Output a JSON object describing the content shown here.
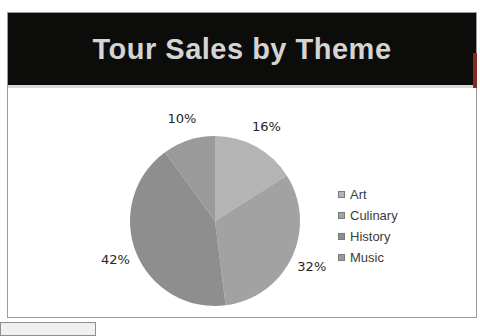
{
  "page": {
    "top_caption": "FIGURE P-65"
  },
  "theme": {
    "banner_background": "#0c0c0b",
    "banner_title_color": "#d4d4d4",
    "accent_red": "#7e2d1e",
    "slide_border": "#9b9b9b"
  },
  "slide": {
    "title": "Tour Sales by Theme"
  },
  "chart_data": {
    "type": "pie",
    "title": "Tour Sales by Theme",
    "categories": [
      "Art",
      "Culinary",
      "History",
      "Music"
    ],
    "values": [
      16,
      32,
      42,
      10
    ],
    "data_labels": [
      "16%",
      "32%",
      "42%",
      "10%"
    ],
    "colors": [
      "#b4b4b4",
      "#a2a2a2",
      "#8e8e8e",
      "#9a9a9a"
    ],
    "start_angle_deg": 0,
    "direction": "clockwise",
    "legend_position": "right",
    "legend": [
      "Art",
      "Culinary",
      "History",
      "Music"
    ]
  }
}
